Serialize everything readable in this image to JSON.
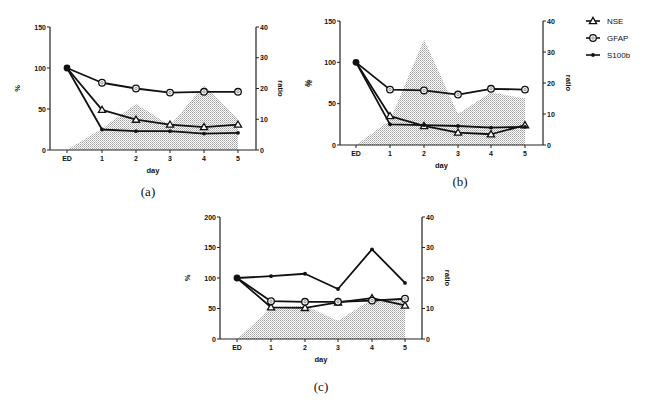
{
  "chart_data": [
    {
      "panel": "(a)",
      "type": "line",
      "categories": [
        "ED",
        "1",
        "2",
        "3",
        "4",
        "5"
      ],
      "xlabel": "day",
      "ylabel": "%",
      "ylabel_right": "ratio",
      "ylim": [
        0,
        150
      ],
      "yticks": [
        0,
        50,
        100,
        150
      ],
      "ylim_right": [
        0,
        40
      ],
      "yticks_right": [
        0,
        10,
        20,
        30,
        40
      ],
      "series": [
        {
          "name": "NSE",
          "marker": "triangle-open",
          "axis": "left",
          "values": [
            100,
            49,
            37,
            31,
            28,
            31
          ]
        },
        {
          "name": "GFAP",
          "marker": "circle-open",
          "axis": "left",
          "values": [
            100,
            82,
            75,
            70,
            71,
            71
          ]
        },
        {
          "name": "S100b",
          "marker": "dot",
          "axis": "left",
          "values": [
            100,
            25,
            23,
            23,
            20,
            21
          ]
        },
        {
          "name": "ratio",
          "type": "area",
          "axis": "right",
          "values": [
            0,
            7,
            15,
            8,
            21,
            10
          ]
        }
      ],
      "extra_label": "%"
    },
    {
      "panel": "(b)",
      "type": "line",
      "categories": [
        "ED",
        "1",
        "2",
        "3",
        "4",
        "5"
      ],
      "xlabel": "day",
      "ylabel": "%",
      "ylabel_right": "ratio",
      "ylim": [
        0,
        150
      ],
      "yticks": [
        0,
        50,
        100,
        150
      ],
      "ylim_right": [
        0,
        40
      ],
      "yticks_right": [
        0,
        10,
        20,
        30,
        40
      ],
      "series": [
        {
          "name": "NSE",
          "marker": "triangle-open",
          "axis": "left",
          "values": [
            100,
            35,
            23,
            15,
            13,
            24
          ]
        },
        {
          "name": "GFAP",
          "marker": "circle-open",
          "axis": "left",
          "values": [
            100,
            67,
            66,
            61,
            68,
            67
          ]
        },
        {
          "name": "S100b",
          "marker": "dot",
          "axis": "left",
          "values": [
            100,
            25,
            24,
            23,
            21,
            22
          ]
        },
        {
          "name": "ratio",
          "type": "area",
          "axis": "right",
          "values": [
            0,
            8,
            34,
            10,
            17,
            15
          ]
        }
      ]
    },
    {
      "panel": "(c)",
      "type": "line",
      "categories": [
        "ED",
        "1",
        "2",
        "3",
        "4",
        "5"
      ],
      "xlabel": "day",
      "ylabel": "%",
      "ylabel_right": "ratio",
      "ylim": [
        0,
        200
      ],
      "yticks": [
        0,
        50,
        100,
        150,
        200
      ],
      "ylim_right": [
        0,
        40
      ],
      "yticks_right": [
        0,
        10,
        20,
        30,
        40
      ],
      "series": [
        {
          "name": "NSE",
          "marker": "triangle-open",
          "axis": "left",
          "values": [
            100,
            52,
            51,
            60,
            67,
            55
          ]
        },
        {
          "name": "GFAP",
          "marker": "circle-open",
          "axis": "left",
          "values": [
            100,
            62,
            61,
            61,
            63,
            66
          ]
        },
        {
          "name": "S100b",
          "marker": "dot",
          "axis": "left",
          "values": [
            100,
            103,
            107,
            82,
            147,
            92
          ]
        },
        {
          "name": "ratio",
          "type": "area",
          "axis": "right",
          "values": [
            0,
            10,
            11,
            6,
            13,
            13
          ]
        }
      ]
    }
  ],
  "legend": {
    "position": "right of panel (b)",
    "entries": [
      {
        "label": "NSE",
        "marker": "triangle-open"
      },
      {
        "label": "GFAP",
        "marker": "circle-open"
      },
      {
        "label": "S100b",
        "marker": "dot"
      }
    ]
  },
  "colors": {
    "line": "#111111",
    "area_pattern": "#9a9a9a"
  }
}
